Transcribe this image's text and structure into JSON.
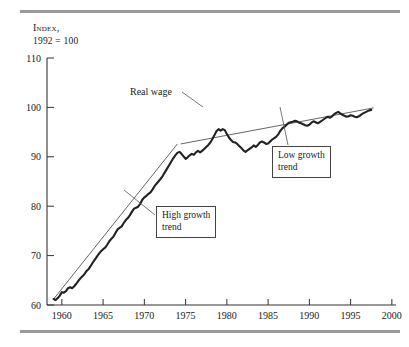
{
  "figure": {
    "axis_title_line1": "Index,",
    "axis_title_line2": "1992 = 100",
    "rule_color": "#9a9a9a",
    "series_color": "#222222",
    "trend_color": "#555555"
  },
  "annotations": {
    "real_wage_label": "Real wage",
    "low_growth_line1": "Low growth",
    "low_growth_line2": "trend",
    "high_growth_line1": "High growth",
    "high_growth_line2": "trend"
  },
  "chart_data": {
    "type": "line",
    "title": "Index, 1992 = 100",
    "xlabel": "",
    "ylabel": "Index, 1992 = 100",
    "xlim": [
      1958.2,
      2000.5
    ],
    "ylim": [
      60,
      110
    ],
    "xticks": [
      1960,
      1965,
      1970,
      1975,
      1980,
      1985,
      1990,
      1995,
      2000
    ],
    "yticks": [
      60,
      70,
      80,
      90,
      100,
      110
    ],
    "grid": false,
    "legend": "none",
    "series": [
      {
        "name": "Real wage",
        "type": "line",
        "x": [
          1959.0,
          1959.25,
          1959.5,
          1959.75,
          1960.0,
          1960.25,
          1960.5,
          1960.75,
          1961.0,
          1961.25,
          1961.5,
          1961.75,
          1962.0,
          1962.25,
          1962.5,
          1962.75,
          1963.0,
          1963.25,
          1963.5,
          1963.75,
          1964.0,
          1964.25,
          1964.5,
          1964.75,
          1965.0,
          1965.25,
          1965.5,
          1965.75,
          1966.0,
          1966.25,
          1966.5,
          1966.75,
          1967.0,
          1967.25,
          1967.5,
          1967.75,
          1968.0,
          1968.25,
          1968.5,
          1968.75,
          1969.0,
          1969.25,
          1969.5,
          1969.75,
          1970.0,
          1970.25,
          1970.5,
          1970.75,
          1971.0,
          1971.25,
          1971.5,
          1971.75,
          1972.0,
          1972.25,
          1972.5,
          1972.75,
          1973.0,
          1973.25,
          1973.5,
          1973.75,
          1974.0,
          1974.25,
          1974.5,
          1974.75,
          1975.0,
          1975.25,
          1975.5,
          1975.75,
          1976.0,
          1976.25,
          1976.5,
          1976.75,
          1977.0,
          1977.25,
          1977.5,
          1977.75,
          1978.0,
          1978.25,
          1978.5,
          1978.75,
          1979.0,
          1979.25,
          1979.5,
          1979.75,
          1980.0,
          1980.25,
          1980.5,
          1980.75,
          1981.0,
          1981.25,
          1981.5,
          1981.75,
          1982.0,
          1982.25,
          1982.5,
          1982.75,
          1983.0,
          1983.25,
          1983.5,
          1983.75,
          1984.0,
          1984.25,
          1984.5,
          1984.75,
          1985.0,
          1985.25,
          1985.5,
          1985.75,
          1986.0,
          1986.25,
          1986.5,
          1986.75,
          1987.0,
          1987.25,
          1987.5,
          1987.75,
          1988.0,
          1988.25,
          1988.5,
          1988.75,
          1989.0,
          1989.25,
          1989.5,
          1989.75,
          1990.0,
          1990.25,
          1990.5,
          1990.75,
          1991.0,
          1991.25,
          1991.5,
          1991.75,
          1992.0,
          1992.25,
          1992.5,
          1992.75,
          1993.0,
          1993.25,
          1993.5,
          1993.75,
          1994.0,
          1994.25,
          1994.5,
          1994.75,
          1995.0,
          1995.25,
          1995.5,
          1995.75,
          1996.0,
          1996.25,
          1996.5,
          1996.75,
          1997.0,
          1997.25,
          1997.5
        ],
        "y": [
          61.2,
          61.0,
          61.4,
          61.9,
          62.6,
          62.5,
          62.8,
          63.4,
          63.6,
          63.4,
          63.8,
          64.3,
          64.9,
          65.4,
          65.8,
          66.3,
          66.9,
          67.3,
          67.9,
          68.6,
          69.2,
          69.8,
          70.4,
          70.9,
          71.3,
          71.6,
          72.2,
          72.9,
          73.4,
          73.8,
          74.6,
          75.3,
          75.6,
          75.9,
          76.6,
          77.2,
          77.6,
          78.2,
          78.9,
          79.5,
          79.7,
          79.9,
          80.5,
          81.3,
          81.8,
          82.1,
          82.5,
          82.8,
          83.4,
          84.1,
          84.6,
          85.1,
          85.6,
          86.2,
          86.9,
          87.6,
          88.3,
          89.0,
          89.7,
          90.3,
          90.8,
          91.0,
          90.6,
          90.1,
          89.6,
          89.9,
          90.3,
          90.6,
          90.4,
          90.9,
          91.2,
          90.9,
          91.2,
          91.6,
          92.0,
          92.4,
          92.9,
          93.6,
          94.4,
          95.2,
          95.6,
          95.3,
          95.6,
          95.4,
          94.6,
          93.9,
          93.4,
          93.0,
          92.9,
          92.6,
          92.2,
          91.8,
          91.3,
          91.0,
          91.3,
          91.6,
          91.9,
          92.3,
          92.0,
          92.4,
          92.9,
          93.1,
          92.9,
          92.6,
          92.7,
          93.1,
          93.5,
          93.8,
          94.1,
          94.6,
          95.3,
          95.8,
          96.1,
          96.5,
          96.9,
          97.0,
          97.1,
          97.3,
          97.2,
          96.9,
          96.8,
          96.6,
          96.4,
          96.3,
          96.5,
          96.9,
          97.2,
          97.0,
          96.8,
          97.0,
          97.3,
          97.6,
          97.9,
          98.1,
          97.9,
          98.2,
          98.6,
          98.9,
          99.1,
          98.8,
          98.5,
          98.3,
          98.1,
          98.2,
          98.4,
          98.3,
          98.1,
          98.0,
          98.2,
          98.5,
          98.8,
          99.0,
          99.2,
          99.4,
          99.5
        ]
      },
      {
        "name": "High growth trend",
        "type": "line",
        "x": [
          1959.0,
          1974.0
        ],
        "y": [
          61.2,
          92.6
        ]
      },
      {
        "name": "Low growth trend",
        "type": "line",
        "x": [
          1974.4,
          1997.8
        ],
        "y": [
          92.6,
          99.9
        ]
      }
    ],
    "annotations": [
      {
        "text": "Real wage",
        "x": 1970.5,
        "y": 101.5
      },
      {
        "text": "High growth trend",
        "x": 1973.0,
        "y": 76.0
      },
      {
        "text": "Low growth trend",
        "x": 1987.5,
        "y": 88.0
      }
    ]
  }
}
